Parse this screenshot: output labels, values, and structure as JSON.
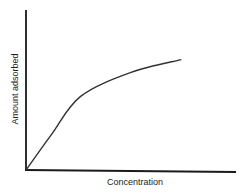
{
  "chart_data": {
    "type": "line",
    "title": "",
    "xlabel": "Concentration",
    "ylabel": "Amount adsorbed",
    "grid": false,
    "legend": null,
    "ticks": false,
    "xlim": [
      0,
      1
    ],
    "ylim": [
      0,
      1
    ],
    "series": [
      {
        "name": "Adsorption isotherm",
        "description": "Saturation curve: rises nearly linearly from origin, then levels off toward a plateau",
        "x": [
          0.0,
          0.12,
          0.26,
          0.5,
          0.74
        ],
        "y": [
          0.0,
          0.22,
          0.46,
          0.61,
          0.69
        ]
      }
    ]
  },
  "colors": {
    "axis": "#1a1a1a",
    "curve": "#333333",
    "background": "#ffffff"
  }
}
